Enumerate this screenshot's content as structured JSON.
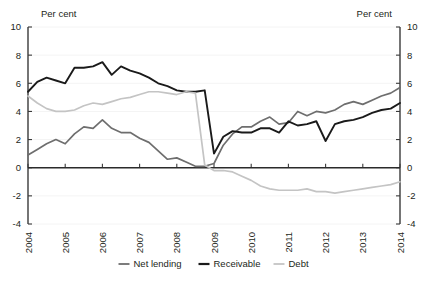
{
  "chart_data": {
    "type": "line",
    "title": "",
    "subtitle": "",
    "xlabel": "",
    "ylabel": "Per cent",
    "ylabel_right": "Per cent",
    "ylim": [
      -4,
      10
    ],
    "yticks": [
      10,
      8,
      6,
      4,
      2,
      0,
      -2,
      -4
    ],
    "yticks_right": [
      10,
      8,
      6,
      4,
      2,
      0,
      -2,
      -4
    ],
    "xlim": [
      2004,
      2014
    ],
    "xticks": [
      2004,
      2005,
      2006,
      2007,
      2008,
      2009,
      2010,
      2011,
      2012,
      2013,
      2014
    ],
    "xtick_labels": [
      "2004",
      "2005",
      "2006",
      "2007",
      "2008",
      "2009",
      "2010",
      "2011",
      "2012",
      "2013",
      "2014"
    ],
    "grid": true,
    "legend_position": "bottom",
    "x": [
      2004.0,
      2004.25,
      2004.5,
      2004.75,
      2005.0,
      2005.25,
      2005.5,
      2005.75,
      2006.0,
      2006.25,
      2006.5,
      2006.75,
      2007.0,
      2007.25,
      2007.5,
      2007.75,
      2008.0,
      2008.25,
      2008.5,
      2008.75,
      2009.0,
      2009.25,
      2009.5,
      2009.75,
      2010.0,
      2010.25,
      2010.5,
      2010.75,
      2011.0,
      2011.25,
      2011.5,
      2011.75,
      2012.0,
      2012.25,
      2012.5,
      2012.75,
      2013.0,
      2013.25,
      2013.5,
      2013.75,
      2014.0
    ],
    "series": [
      {
        "name": "Net lending",
        "color": "#6e6e6e",
        "width": 1.7,
        "values": [
          0.9,
          1.3,
          1.7,
          2.0,
          1.7,
          2.4,
          2.9,
          2.8,
          3.4,
          2.8,
          2.5,
          2.5,
          2.1,
          1.8,
          1.2,
          0.6,
          0.7,
          0.4,
          0.1,
          0.1,
          0.3,
          1.6,
          2.4,
          2.9,
          2.9,
          3.3,
          3.6,
          3.1,
          3.2,
          4.0,
          3.7,
          4.0,
          3.9,
          4.1,
          4.5,
          4.7,
          4.5,
          4.8,
          5.1,
          5.3,
          5.7
        ]
      },
      {
        "name": "Receivable",
        "color": "#1a1a1a",
        "width": 1.9,
        "values": [
          5.4,
          6.1,
          6.4,
          6.2,
          6.0,
          7.1,
          7.1,
          7.2,
          7.5,
          6.6,
          7.2,
          6.9,
          6.7,
          6.4,
          6.0,
          5.8,
          5.5,
          5.4,
          5.4,
          5.5,
          1.0,
          2.2,
          2.6,
          2.5,
          2.5,
          2.8,
          2.8,
          2.5,
          3.3,
          3.0,
          3.1,
          3.3,
          1.9,
          3.1,
          3.3,
          3.4,
          3.6,
          3.9,
          4.1,
          4.2,
          4.6
        ]
      },
      {
        "name": "Debt",
        "color": "#c4c4c4",
        "width": 1.7,
        "values": [
          5.1,
          4.6,
          4.2,
          4.0,
          4.0,
          4.1,
          4.4,
          4.6,
          4.5,
          4.7,
          4.9,
          5.0,
          5.2,
          5.4,
          5.4,
          5.3,
          5.2,
          5.4,
          5.3,
          0.2,
          -0.2,
          -0.2,
          -0.3,
          -0.6,
          -0.9,
          -1.3,
          -1.5,
          -1.6,
          -1.6,
          -1.6,
          -1.5,
          -1.7,
          -1.7,
          -1.8,
          -1.7,
          -1.6,
          -1.5,
          -1.4,
          -1.3,
          -1.2,
          -1.0
        ]
      }
    ],
    "legend": [
      {
        "label": "Net lending",
        "color": "#6e6e6e",
        "marker": "line"
      },
      {
        "label": "Receivable",
        "color": "#1a1a1a",
        "marker": "line"
      },
      {
        "label": "Debt",
        "color": "#c4c4c4",
        "marker": "line"
      }
    ]
  }
}
